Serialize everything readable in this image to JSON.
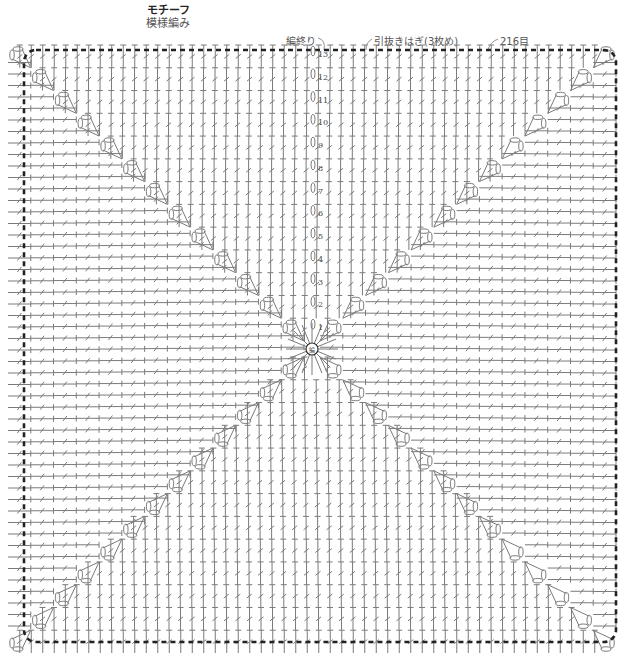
{
  "title": {
    "main": "モチーフ",
    "sub": "模様編み"
  },
  "annotations": {
    "end_of_work": "編終り",
    "join": "引抜きはぎ(3枚め)",
    "stitch_count": "216目"
  },
  "center": {
    "label": "編",
    "meaning": "magic ring / start"
  },
  "rounds": [
    "1",
    "2",
    "3",
    "4",
    "5",
    "6",
    "7",
    "8",
    "9",
    "10",
    "11",
    "12",
    "13"
  ],
  "colors": {
    "line": "#7a7a7a",
    "border": "#222222",
    "text": "#444444"
  },
  "geometry": {
    "border": {
      "x1": 24,
      "y1": 50,
      "x2": 616,
      "y2": 642
    },
    "center": {
      "x": 312,
      "y": 349
    },
    "row_height": 22.6,
    "col_width": 11.5
  }
}
